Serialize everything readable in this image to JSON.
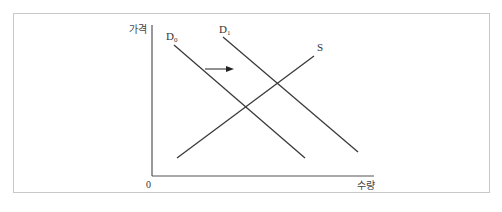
{
  "diagram": {
    "title": "",
    "axes": {
      "y_label": "가격",
      "x_label": "수량",
      "origin_label": "0"
    },
    "curves": [
      {
        "id": "D0",
        "label_main": "D",
        "label_sub": "0",
        "type": "demand",
        "from": [
          174,
          45
        ],
        "to": [
          305,
          158
        ]
      },
      {
        "id": "D1",
        "label_main": "D",
        "label_sub": "1",
        "type": "demand",
        "from": [
          223,
          37
        ],
        "to": [
          358,
          152
        ]
      },
      {
        "id": "S",
        "label_main": "S",
        "label_sub": "",
        "type": "supply",
        "from": [
          177,
          158
        ],
        "to": [
          314,
          56
        ]
      }
    ],
    "shift_arrow": {
      "from": [
        205,
        69
      ],
      "to": [
        233,
        69
      ],
      "meaning": "demand shift right D0 to D1"
    },
    "colors": {
      "line": "#3a3a3a",
      "axis": "#555555",
      "border": "#c8c8c8"
    }
  }
}
